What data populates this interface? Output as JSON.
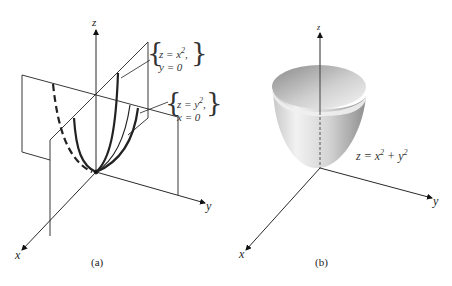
{
  "figure_a": {
    "caption": "(a)",
    "axes": {
      "z": "z",
      "y": "y",
      "x": "x"
    },
    "curve1": {
      "line1": "z = x",
      "exp1": "2",
      "line1_suffix": ",",
      "line2": "y = 0"
    },
    "curve2": {
      "line1": "z = y",
      "exp1": "2",
      "line1_suffix": ",",
      "line2": "x = 0"
    }
  },
  "figure_b": {
    "caption": "(b)",
    "axes": {
      "z": "z",
      "y": "y",
      "x": "x"
    },
    "surface_label": {
      "base": "z = x",
      "exp1": "2",
      "mid": " + y",
      "exp2": "2"
    }
  },
  "colors": {
    "line": "#222222",
    "surface_light": "#f4f4f4",
    "surface_dark": "#9a9a9a"
  }
}
